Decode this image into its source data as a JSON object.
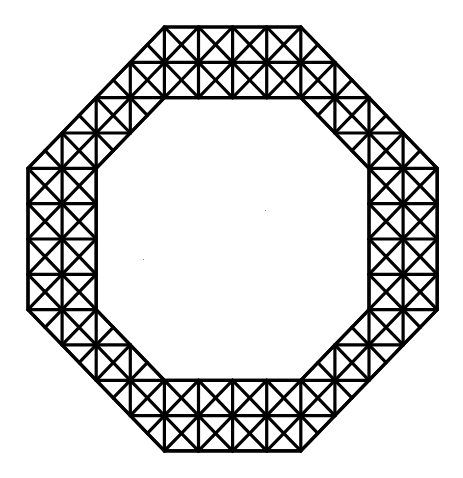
{
  "diagram": {
    "type": "octagonal-triangulated-ring",
    "grid": {
      "size": 12,
      "origin_x": 28,
      "origin_y": 27,
      "unit_x": 34.1,
      "unit_y": 35.33
    },
    "outer_octagon": [
      [
        4,
        0
      ],
      [
        8,
        0
      ],
      [
        12,
        4
      ],
      [
        12,
        8
      ],
      [
        8,
        12
      ],
      [
        4,
        12
      ],
      [
        0,
        8
      ],
      [
        0,
        4
      ]
    ],
    "inner_octagon": [
      [
        4,
        2
      ],
      [
        8,
        2
      ],
      [
        10,
        4
      ],
      [
        10,
        8
      ],
      [
        8,
        10
      ],
      [
        4,
        10
      ],
      [
        2,
        8
      ],
      [
        2,
        4
      ]
    ],
    "stroke_color": "#000000",
    "background_color": "#ffffff",
    "stroke_width": 3.2
  }
}
